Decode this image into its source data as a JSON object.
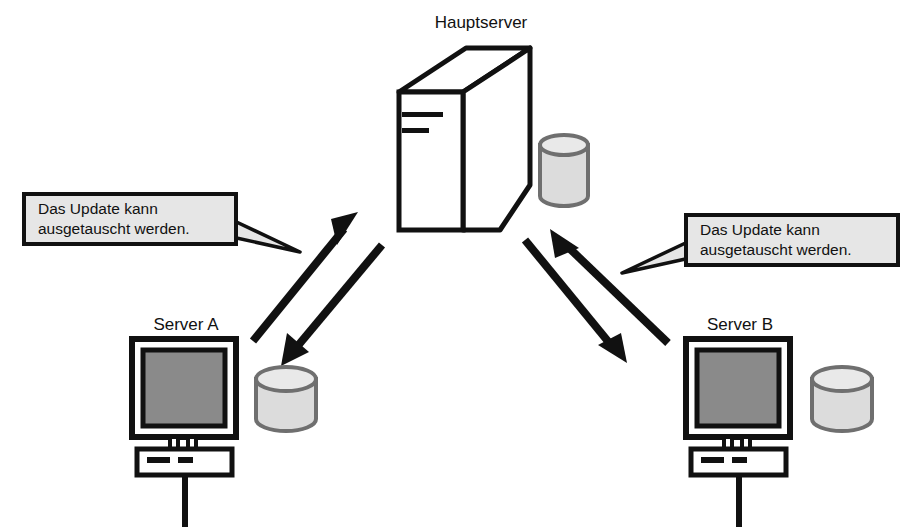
{
  "diagram": {
    "title_label": "Hauptserver",
    "background_color": "#ffffff",
    "ink_color": "#111111",
    "screen_color": "#8a8a8a",
    "disk_fill_color": "#dcdcdc",
    "disk_stroke_color": "#6f6f6f",
    "bubble_fill_color": "#e6e6e6",
    "nodes": {
      "main_server": {
        "label": "Hauptserver",
        "icon": "server-tower-icon",
        "disk_icon": "disk-cylinder-icon"
      },
      "server_a": {
        "label": "Server A",
        "icon": "workstation-icon",
        "disk_icon": "disk-cylinder-icon"
      },
      "server_b": {
        "label": "Server B",
        "icon": "workstation-icon",
        "disk_icon": "disk-cylinder-icon"
      }
    },
    "callouts": [
      {
        "id": "callout-left",
        "line1": "Das Update kann",
        "line2": "ausgetauscht werden.",
        "tail_direction": "right"
      },
      {
        "id": "callout-right",
        "line1": "Das Update kann",
        "line2": "ausgetauscht werden.",
        "tail_direction": "left"
      }
    ],
    "connections": [
      {
        "id": "link-server-a",
        "from": "server_a",
        "to": "main_server",
        "style": "double-arrow"
      },
      {
        "id": "link-server-b",
        "from": "server_b",
        "to": "main_server",
        "style": "double-arrow"
      }
    ]
  }
}
